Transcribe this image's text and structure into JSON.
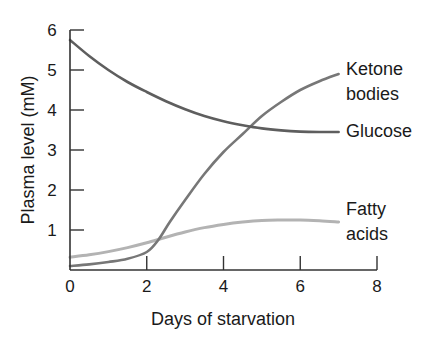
{
  "chart_data": {
    "type": "line",
    "title": "",
    "xlabel": "Days of starvation",
    "ylabel": "Plasma level (mM)",
    "xlim": [
      0,
      8
    ],
    "ylim": [
      0,
      6
    ],
    "xticks": [
      0,
      2,
      4,
      6,
      8
    ],
    "yticks": [
      0,
      1,
      2,
      3,
      4,
      5,
      6
    ],
    "grid": false,
    "legend": "direct labels at line ends (right)",
    "series": [
      {
        "name": "Glucose",
        "label": "Glucose",
        "color": "#5e5e5e",
        "x": [
          0,
          0.5,
          1,
          1.5,
          2,
          2.5,
          3,
          3.5,
          4,
          4.5,
          5,
          5.5,
          6,
          6.5,
          7
        ],
        "values": [
          5.75,
          5.35,
          5.0,
          4.7,
          4.45,
          4.22,
          4.02,
          3.85,
          3.72,
          3.62,
          3.54,
          3.49,
          3.46,
          3.45,
          3.45
        ]
      },
      {
        "name": "Ketone bodies",
        "label": [
          "Ketone",
          "bodies"
        ],
        "color": "#777777",
        "x": [
          0,
          0.5,
          1,
          1.5,
          2,
          2.3,
          2.6,
          3,
          3.5,
          4,
          4.5,
          5,
          5.5,
          6,
          6.5,
          7
        ],
        "values": [
          0.1,
          0.14,
          0.2,
          0.28,
          0.45,
          0.75,
          1.2,
          1.75,
          2.4,
          2.95,
          3.4,
          3.85,
          4.2,
          4.5,
          4.72,
          4.9
        ]
      },
      {
        "name": "Fatty acids",
        "label": [
          "Fatty",
          "acids"
        ],
        "color": "#b3b3b3",
        "x": [
          0,
          0.5,
          1,
          1.5,
          2,
          2.5,
          3,
          3.5,
          4,
          4.5,
          5,
          5.5,
          6,
          6.5,
          7
        ],
        "values": [
          0.32,
          0.38,
          0.46,
          0.56,
          0.68,
          0.82,
          0.95,
          1.06,
          1.14,
          1.2,
          1.24,
          1.25,
          1.25,
          1.23,
          1.2
        ]
      }
    ]
  }
}
